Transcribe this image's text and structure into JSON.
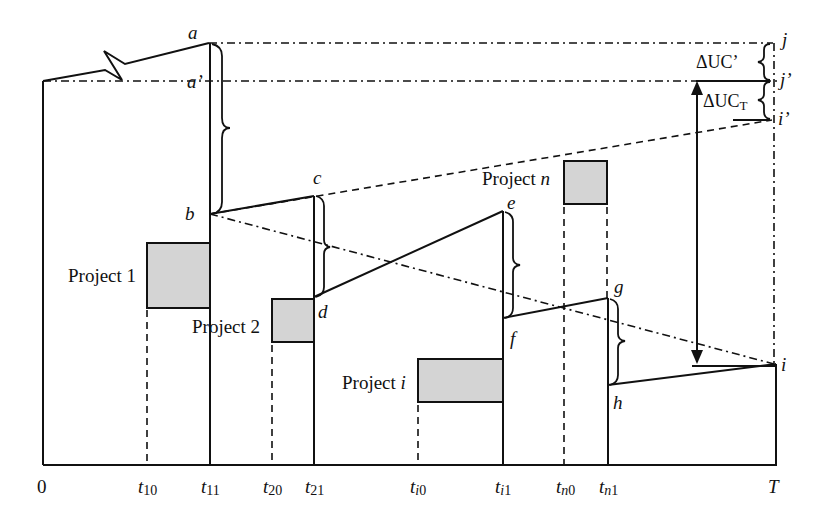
{
  "diagram": {
    "type": "unit-cost-timeline",
    "points": {
      "a": "a",
      "a_prime": "a’",
      "b": "b",
      "c": "c",
      "d": "d",
      "e": "e",
      "f": "f",
      "g": "g",
      "h": "h",
      "i": "i",
      "i_prime": "i’",
      "j": "j",
      "j_prime": "j’"
    },
    "projects": [
      {
        "id": "project-1",
        "label": "Project 1",
        "start": "t10",
        "end": "t11"
      },
      {
        "id": "project-2",
        "label": "Project 2",
        "start": "t20",
        "end": "t21"
      },
      {
        "id": "project-i",
        "label_prefix": "Project ",
        "label_var": "i",
        "start": "ti0",
        "end": "ti1"
      },
      {
        "id": "project-n",
        "label_prefix": "Project ",
        "label_var": "n",
        "start": "tn0",
        "end": "tn1"
      }
    ],
    "deltas": {
      "uc_prime": {
        "prefix": "ΔUC",
        "suffix": "’"
      },
      "uc_t": {
        "prefix": "ΔUC",
        "subscript": "T"
      }
    },
    "axis": {
      "origin": "0",
      "end": "T",
      "ticks": [
        {
          "base": "t",
          "sub": "10"
        },
        {
          "base": "t",
          "sub": "11"
        },
        {
          "base": "t",
          "sub": "20"
        },
        {
          "base": "t",
          "sub": "21"
        },
        {
          "base": "t",
          "sub": "i",
          "sub2": "0"
        },
        {
          "base": "t",
          "sub": "i",
          "sub2": "1"
        },
        {
          "base": "t",
          "sub": "n",
          "sub2": "0"
        },
        {
          "base": "t",
          "sub": "n",
          "sub2": "1"
        }
      ]
    },
    "colors": {
      "line": "#111111",
      "box_fill": "#d4d4d4",
      "background": "#ffffff"
    }
  }
}
